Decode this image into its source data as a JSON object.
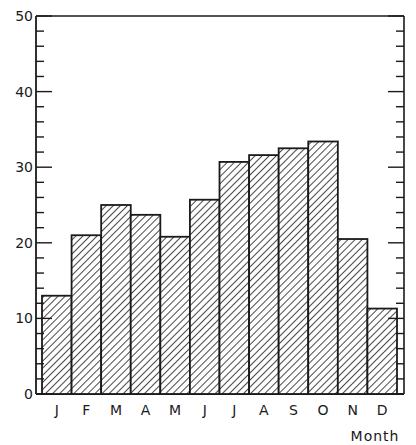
{
  "chart_data": {
    "type": "bar",
    "title": "",
    "xlabel": "Month",
    "ylabel": "",
    "categories": [
      "J",
      "F",
      "M",
      "A",
      "M",
      "J",
      "J",
      "A",
      "S",
      "O",
      "N",
      "D"
    ],
    "values": [
      13,
      21,
      25,
      23.7,
      20.8,
      25.7,
      30.7,
      31.6,
      32.5,
      33.4,
      20.5,
      11.3
    ],
    "ylim": [
      0,
      50
    ],
    "yticks": [
      0,
      10,
      20,
      30,
      40,
      50
    ],
    "ytick_labels": [
      "0",
      "10",
      "20",
      "30",
      "40",
      "50"
    ],
    "minor_tick_step": 2,
    "grid": false,
    "legend": null,
    "bar_fill": "diagonal-hatch",
    "colors": {
      "ink": "#1a1a1a",
      "background": "#ffffff"
    }
  }
}
